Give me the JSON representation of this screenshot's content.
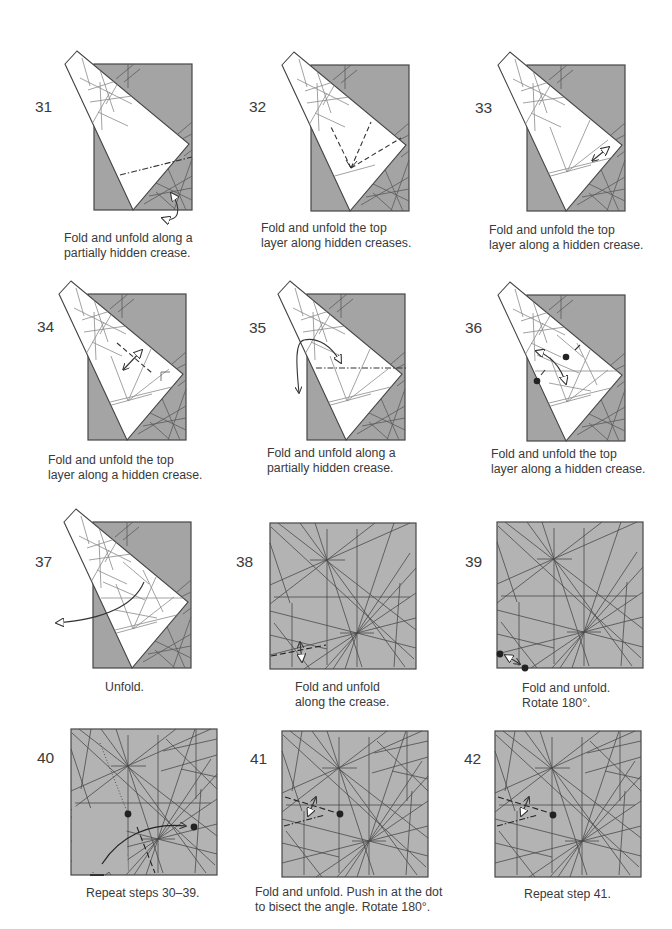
{
  "colors": {
    "folded_paper_gray": "#a4a4a4",
    "square_paper_gray": "#b3b3b3",
    "flap_white": "#ffffff",
    "outline": "#474747",
    "text": "#3a3a3a"
  },
  "steps": [
    {
      "number": "31",
      "caption": [
        "Fold and unfold along a",
        "partially hidden crease."
      ]
    },
    {
      "number": "32",
      "caption": [
        "Fold and unfold the top",
        "layer along hidden creases."
      ]
    },
    {
      "number": "33",
      "caption": [
        "Fold and unfold the top",
        "layer along a hidden crease."
      ]
    },
    {
      "number": "34",
      "caption": [
        "Fold and unfold the top",
        "layer along a hidden crease."
      ]
    },
    {
      "number": "35",
      "caption": [
        "Fold and unfold along a",
        "partially hidden crease."
      ]
    },
    {
      "number": "36",
      "caption": [
        "Fold and unfold the top",
        "layer along a hidden crease."
      ]
    },
    {
      "number": "37",
      "caption": [
        "Unfold."
      ]
    },
    {
      "number": "38",
      "caption": [
        "Fold and unfold",
        "along the crease."
      ]
    },
    {
      "number": "39",
      "caption": [
        "Fold and unfold.",
        "Rotate 180°."
      ]
    },
    {
      "number": "40",
      "caption": [
        "Repeat steps 30–39."
      ]
    },
    {
      "number": "41",
      "caption": [
        "Fold and unfold. Push in at the dot",
        "to bisect the angle. Rotate 180°."
      ]
    },
    {
      "number": "42",
      "caption": [
        "Repeat step 41."
      ]
    }
  ]
}
